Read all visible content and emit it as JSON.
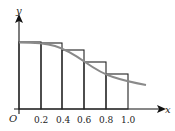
{
  "diagram": {
    "type": "riemann-sum-left-endpoint",
    "axes": {
      "x_label": "x",
      "y_label": "y",
      "origin_label": "O"
    },
    "x_ticks": [
      "0.2",
      "0.4",
      "0.6",
      "0.8",
      "1.0"
    ],
    "rectangles": [
      {
        "x0": 0.0,
        "x1": 0.2,
        "height": 1.0
      },
      {
        "x0": 0.2,
        "x1": 0.4,
        "height": 0.98
      },
      {
        "x0": 0.4,
        "x1": 0.6,
        "height": 0.88
      },
      {
        "x0": 0.6,
        "x1": 0.8,
        "height": 0.7
      },
      {
        "x0": 0.8,
        "x1": 1.0,
        "height": 0.52
      }
    ],
    "curve": {
      "description": "decreasing smooth curve from (0,1) extending past x=1.0",
      "color": "#8a8a8a"
    },
    "colors": {
      "axis": "#111111",
      "rect_stroke": "#222222",
      "curve": "#8a8a8a"
    }
  }
}
